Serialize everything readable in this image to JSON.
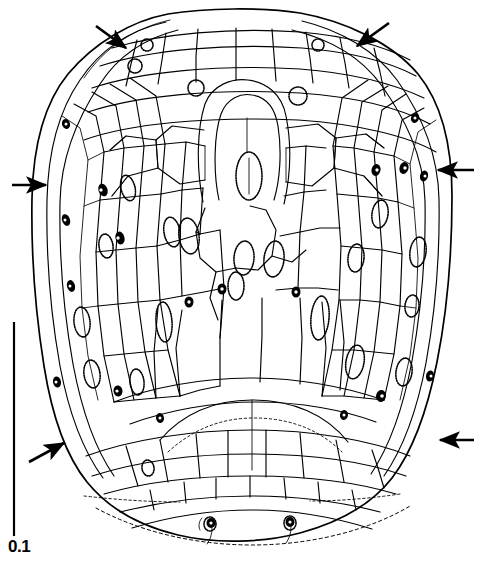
{
  "figure": {
    "background_color": "#ffffff",
    "ink_color": "#000000",
    "width": 481,
    "height": 568
  },
  "scale_bar": {
    "label": "0.1",
    "orientation": "vertical",
    "x": 14,
    "y_top": 322,
    "y_bottom": 536,
    "stroke_width": 2,
    "color": "#000000"
  },
  "annotations": {
    "arrows": [
      {
        "name": "arrow-top-left",
        "tail_x": 96,
        "tail_y": 26,
        "tip_x": 131,
        "tip_y": 52,
        "direction": "down-right"
      },
      {
        "name": "arrow-top-right",
        "tail_x": 389,
        "tail_y": 23,
        "tip_x": 352,
        "tip_y": 50,
        "direction": "down-left"
      },
      {
        "name": "arrow-middle-left",
        "tail_x": 10,
        "tail_y": 185,
        "tip_x": 50,
        "tip_y": 185,
        "direction": "right"
      },
      {
        "name": "arrow-middle-right",
        "tail_x": 474,
        "tail_y": 170,
        "tip_x": 434,
        "tip_y": 170,
        "direction": "left"
      },
      {
        "name": "arrow-bottom-left",
        "tail_x": 29,
        "tail_y": 462,
        "tip_x": 68,
        "tip_y": 440,
        "direction": "up-right"
      },
      {
        "name": "arrow-bottom-right",
        "tail_x": 474,
        "tail_y": 440,
        "tip_x": 436,
        "tip_y": 440,
        "direction": "left"
      }
    ],
    "arrow_count": 6,
    "arrow_color": "#000000"
  },
  "specimen": {
    "outline_description": "broad ovate-obovate body, truncate-rounded apex, rounded base, bilaterally symmetric",
    "apex_y": 12,
    "base_y": 545,
    "left_x": 32,
    "right_x": 452,
    "central_structure": {
      "name": "apical-keyhole-cell-complex",
      "description": "elongate U-shaped (keyhole) cell in upper centre enclosing a narrow stippled ovoid",
      "cx": 243,
      "top_y": 84,
      "bottom_y": 205
    },
    "basal_region": {
      "description": "transversely elongate small cells with dashed basal margin arc",
      "dashed_margin": true
    },
    "cells": {
      "description": "polygonal to elongate-rectangular epidermal cells; elongate and narrow toward the lateral margins, isodiametric toward the centre",
      "approximate_count": 260,
      "stroke_width": 1.1
    },
    "stomata": {
      "description": "oval pores with stippled/dashed guard-cell rims, scattered over the surface, denser toward the lateral thirds",
      "approximate_count": 40,
      "rim_style": "dotted"
    }
  }
}
